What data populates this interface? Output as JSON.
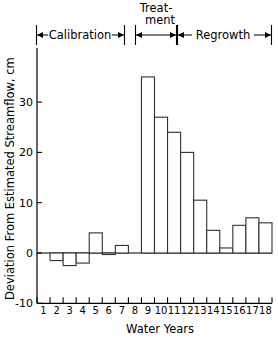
{
  "chart_data": {
    "type": "bar",
    "title": "",
    "xlabel": "Water Years",
    "ylabel": "Deviation From Estimated Streamflow, cm",
    "categories": [
      "1",
      "2",
      "3",
      "4",
      "5",
      "6",
      "7",
      "8",
      "9",
      "10",
      "11",
      "12",
      "13",
      "14",
      "15",
      "16",
      "17",
      "18"
    ],
    "values": [
      0,
      -1.5,
      -2.5,
      -2,
      4,
      -0.3,
      1.5,
      0,
      35,
      27,
      24,
      20,
      10.5,
      4.5,
      1,
      5.5,
      7,
      6
    ],
    "ylim": [
      -10,
      38
    ],
    "yticks": [
      -10,
      0,
      10,
      20,
      30
    ],
    "ytick_labels": [
      "-10",
      "0",
      "10",
      "20",
      "30"
    ],
    "xlim": [
      0.5,
      18.5
    ],
    "grid": false,
    "legend": false,
    "annotations": [
      {
        "label": "Calibration",
        "start_year": 1,
        "end_year": 8
      },
      {
        "label": "Treat-\nment",
        "start_year": 9,
        "end_year": 11
      },
      {
        "label": "Regrowth",
        "start_year": 12,
        "end_year": 18
      }
    ]
  },
  "axes": {
    "y_title": "Deviation From Estimated Streamflow, cm",
    "x_title": "Water Years",
    "y_tick_labels": [
      "30",
      "20",
      "10",
      "0",
      "-10"
    ],
    "x_tick_labels": [
      "1",
      "2",
      "3",
      "4",
      "5",
      "6",
      "7",
      "8",
      "9",
      "10",
      "11",
      "12",
      "13",
      "14",
      "15",
      "16",
      "17",
      "18"
    ]
  },
  "phases": {
    "calibration_label": "Calibration",
    "treatment_label_line1": "Treat-",
    "treatment_label_line2": "ment",
    "regrowth_label": "Regrowth"
  },
  "colors": {
    "bar_fill": "#ffffff",
    "bar_stroke": "#303030",
    "axis": "#000000",
    "background": "#ffffff"
  }
}
